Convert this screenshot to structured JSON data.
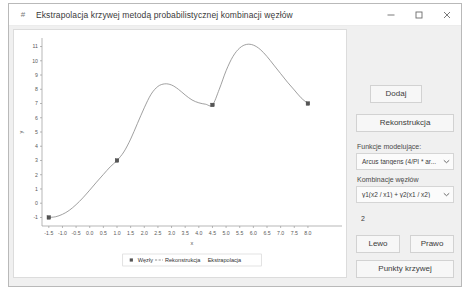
{
  "window": {
    "title": "Ekstrapolacja krzywej metodą probabilistycznej kombinacji węzłów",
    "app_icon": "hash-icon",
    "minimize_label": "—",
    "maximize_label": "□",
    "close_label": "✕",
    "border_color": "#b9b9b9",
    "titlebar_bg": "#ffffff",
    "body_bg": "#f0f0f0"
  },
  "panel": {
    "add_label": "Dodaj",
    "reconstruct_label": "Rekonstrukcja",
    "modeling_functions_label": "Funkcje modelujące:",
    "modeling_functions_value": "Arcus tangens (4/PI * ar...",
    "node_combination_label": "Kombinacje węzłów",
    "node_combination_value": "y1(x2 / x1) + y2(x1 / x2)",
    "count_value": "2",
    "left_label": "Lewo",
    "right_label": "Prawo",
    "curve_points_label": "Punkty krzywej",
    "dropdown_arrow": "▾",
    "button_bg": "#f7f7f7",
    "button_border": "#d2d2d2"
  },
  "chart_data": {
    "type": "line",
    "title": "",
    "xlabel": "x",
    "ylabel": "y",
    "xlim": [
      -1.75,
      9.25
    ],
    "ylim": [
      -1.6,
      11.6
    ],
    "xticks": [
      "-1.5",
      "-1.0",
      "-0.5",
      "0.0",
      "0.5",
      "1.0",
      "1.5",
      "2.0",
      "2.5",
      "3.0",
      "3.5",
      "4.0",
      "4.5",
      "5.0",
      "5.5",
      "6.0",
      "6.5",
      "7.0",
      "7.5",
      "8.0"
    ],
    "xtick_values": [
      -1.5,
      -1.0,
      -0.5,
      0.0,
      0.5,
      1.0,
      1.5,
      2.0,
      2.5,
      3.0,
      3.5,
      4.0,
      4.5,
      5.0,
      5.5,
      6.0,
      6.5,
      7.0,
      7.5,
      8.0
    ],
    "yticks": [
      "-1",
      "0",
      "1",
      "2",
      "3",
      "4",
      "5",
      "6",
      "7",
      "8",
      "9",
      "10",
      "11"
    ],
    "ytick_values": [
      -1,
      0,
      1,
      2,
      3,
      4,
      5,
      6,
      7,
      8,
      9,
      10,
      11
    ],
    "grid": false,
    "legend_position": "below",
    "legend": [
      {
        "label": "Węzły",
        "marker": "square",
        "color": "#555555"
      },
      {
        "label": "Rekonstrukcja",
        "marker": "dashed-line",
        "color": "#777777"
      },
      {
        "label": "Ekstrapolacja",
        "marker": "none",
        "color": "#777777"
      }
    ],
    "nodes": {
      "name": "Węzły",
      "x": [
        -1.5,
        1.0,
        4.5,
        8.0
      ],
      "y": [
        -1.0,
        3.0,
        6.9,
        7.0
      ]
    },
    "curve": {
      "name": "Rekonstrukcja",
      "color": "#808080",
      "x": [
        -1.5,
        -1.25,
        -1.0,
        -0.75,
        -0.5,
        -0.25,
        0.0,
        0.25,
        0.5,
        0.75,
        1.0,
        1.25,
        1.5,
        1.75,
        2.0,
        2.25,
        2.5,
        2.75,
        3.0,
        3.25,
        3.5,
        3.75,
        4.0,
        4.25,
        4.5,
        4.75,
        5.0,
        5.25,
        5.5,
        5.75,
        6.0,
        6.25,
        6.5,
        6.75,
        7.0,
        7.25,
        7.5,
        7.75,
        8.0
      ],
      "y": [
        -1.0,
        -0.95,
        -0.78,
        -0.5,
        -0.1,
        0.38,
        0.92,
        1.48,
        2.02,
        2.55,
        3.0,
        3.6,
        4.5,
        5.6,
        6.7,
        7.65,
        8.2,
        8.38,
        8.3,
        8.0,
        7.6,
        7.25,
        7.05,
        6.95,
        6.9,
        8.0,
        9.3,
        10.3,
        10.9,
        11.15,
        11.1,
        10.8,
        10.3,
        9.7,
        9.1,
        8.5,
        7.95,
        7.4,
        7.0
      ]
    }
  }
}
